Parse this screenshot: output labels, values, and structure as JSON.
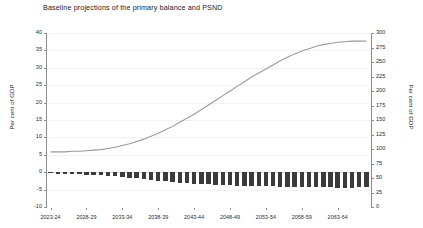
{
  "chart_data": {
    "type": "bar",
    "title": "Baseline projections of the primary balance and PSND",
    "xlabel": "",
    "ylabel": "Per cent of GDP",
    "y2label": "Per cent of GDP",
    "ylim": [
      -10,
      40
    ],
    "y2lim": [
      0,
      300
    ],
    "yticks": [
      40,
      35,
      30,
      25,
      20,
      15,
      10,
      5,
      0,
      -5,
      -10
    ],
    "ytick_labels": [
      "40",
      "35",
      "30",
      "25",
      "20",
      "15",
      "10",
      "5",
      "0",
      "-5",
      "-10"
    ],
    "y2ticks": [
      300,
      275,
      250,
      225,
      200,
      175,
      150,
      125,
      100,
      75,
      50,
      25,
      0
    ],
    "y2tick_labels": [
      "300",
      "275",
      "250",
      "225",
      "200",
      "175",
      "150",
      "125",
      "100",
      "75",
      "50",
      "25",
      "0"
    ],
    "grid": true,
    "legend": "none",
    "categories": [
      "2023-24",
      "2024-25",
      "2025-26",
      "2026-27",
      "2027-28",
      "2028-29",
      "2029-30",
      "2030-31",
      "2031-32",
      "2032-33",
      "2033-34",
      "2034-35",
      "2035-36",
      "2036-37",
      "2037-38",
      "2038-39",
      "2039-40",
      "2040-41",
      "2041-42",
      "2042-43",
      "2043-44",
      "2044-45",
      "2045-46",
      "2046-47",
      "2047-48",
      "2048-49",
      "2049-50",
      "2050-51",
      "2051-52",
      "2052-53",
      "2053-54",
      "2054-55",
      "2055-56",
      "2056-57",
      "2057-58",
      "2058-59",
      "2059-60",
      "2060-61",
      "2061-62",
      "2062-63",
      "2063-64",
      "2064-65",
      "2065-66",
      "2066-67",
      "2067-68"
    ],
    "xtick_labels": [
      "2023-24",
      "2028-29",
      "2033-34",
      "2038-39",
      "2043-44",
      "2048-49",
      "2053-54",
      "2058-59",
      "2063-64"
    ],
    "xtick_indices": [
      0,
      5,
      10,
      15,
      20,
      25,
      30,
      35,
      40
    ],
    "series": [
      {
        "name": "Primary balance",
        "type": "bar",
        "axis": "left",
        "unit": "Per cent of GDP",
        "color": "#3b3b3b",
        "values": [
          -0.3,
          -0.4,
          -0.4,
          -0.5,
          -0.6,
          -0.7,
          -0.8,
          -0.9,
          -1.0,
          -1.2,
          -1.4,
          -1.6,
          -1.8,
          -2.0,
          -2.2,
          -2.4,
          -2.6,
          -2.8,
          -3.0,
          -3.1,
          -3.3,
          -3.4,
          -3.5,
          -3.6,
          -3.7,
          -3.8,
          -3.9,
          -3.9,
          -4.0,
          -4.0,
          -4.1,
          -4.1,
          -4.2,
          -4.2,
          -4.3,
          -4.3,
          -4.3,
          -4.4,
          -4.4,
          -4.4,
          -4.5,
          -4.5,
          -4.5,
          -4.4,
          -4.3
        ]
      },
      {
        "name": "PSND",
        "type": "line",
        "axis": "right",
        "unit": "Per cent of GDP",
        "color": "#9a9a9a",
        "values": [
          95,
          95,
          95,
          96,
          96,
          97,
          98,
          99,
          101,
          103,
          106,
          109,
          113,
          117,
          122,
          127,
          133,
          139,
          146,
          153,
          160,
          168,
          176,
          184,
          192,
          200,
          208,
          216,
          224,
          231,
          238,
          245,
          252,
          258,
          264,
          269,
          273,
          277,
          280,
          282,
          284,
          285,
          286,
          286,
          286
        ]
      }
    ]
  }
}
